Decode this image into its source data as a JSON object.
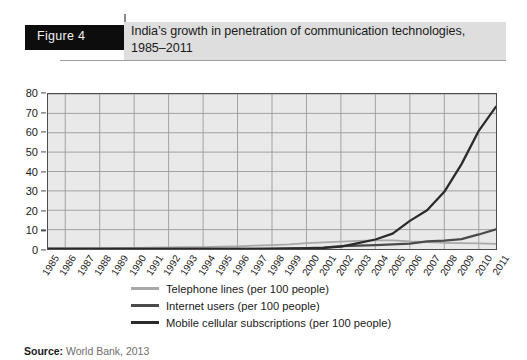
{
  "header": {
    "figure_tag": "Figure 4",
    "title": "India’s growth in penetration of communication technologies, 1985–2011"
  },
  "source": {
    "label": "Source:",
    "text": "World Bank, 2013"
  },
  "colors": {
    "telephone": "#a8a8a8",
    "internet": "#4a4a4a",
    "mobile": "#2b2b2b",
    "plot_background": "#e9e9e9",
    "gridline": "#9a9a9a",
    "axis": "#4d4d4d"
  },
  "chart_data": {
    "type": "line",
    "title": "India’s growth in penetration of communication technologies, 1985–2011",
    "xlabel": "",
    "ylabel": "",
    "ylim": [
      0,
      80
    ],
    "yticks": [
      0,
      10,
      20,
      30,
      40,
      50,
      60,
      70,
      80
    ],
    "grid": true,
    "legend_position": "bottom",
    "x": [
      1985,
      1986,
      1987,
      1988,
      1989,
      1990,
      1991,
      1992,
      1993,
      1994,
      1995,
      1996,
      1997,
      1998,
      1999,
      2000,
      2001,
      2002,
      2003,
      2004,
      2005,
      2006,
      2007,
      2008,
      2009,
      2010,
      2011
    ],
    "categories": [
      "1985",
      "1986",
      "1987",
      "1988",
      "1989",
      "1990",
      "1991",
      "1992",
      "1993",
      "1994",
      "1995",
      "1996",
      "1997",
      "1998",
      "1999",
      "2000",
      "2001",
      "2002",
      "2003",
      "2004",
      "2005",
      "2006",
      "2007",
      "2008",
      "2009",
      "2010",
      "2011"
    ],
    "series": [
      {
        "name": "Telephone lines (per 100 people)",
        "legend_label": "Telephone lines (per 100 people)",
        "color": "#a8a8a8",
        "values": [
          0.4,
          0.4,
          0.5,
          0.5,
          0.6,
          0.6,
          0.7,
          0.8,
          0.9,
          1.0,
          1.2,
          1.4,
          1.7,
          2.0,
          2.4,
          3.0,
          3.4,
          3.8,
          4.2,
          4.4,
          4.5,
          3.9,
          3.5,
          3.2,
          3.0,
          2.9,
          2.6
        ]
      },
      {
        "name": "Internet users (per 100 people)",
        "legend_label": "Internet users (per 100 people)",
        "color": "#4a4a4a",
        "values": [
          0.0,
          0.0,
          0.0,
          0.0,
          0.0,
          0.0,
          0.0,
          0.0,
          0.0,
          0.0,
          0.03,
          0.05,
          0.1,
          0.14,
          0.27,
          0.5,
          0.66,
          1.54,
          1.69,
          1.98,
          2.39,
          2.81,
          3.95,
          4.38,
          5.12,
          7.5,
          10.1
        ]
      },
      {
        "name": "Mobile  cellular subscriptions (per 100 people)",
        "legend_label": "Mobile  cellular subscriptions (per 100 people)",
        "color": "#2b2b2b",
        "values": [
          0.0,
          0.0,
          0.0,
          0.0,
          0.0,
          0.0,
          0.0,
          0.0,
          0.0,
          0.0,
          0.01,
          0.03,
          0.08,
          0.12,
          0.19,
          0.35,
          0.62,
          1.2,
          3.0,
          4.9,
          7.9,
          14.5,
          20.0,
          29.5,
          43.8,
          61.0,
          73.5
        ]
      }
    ]
  }
}
